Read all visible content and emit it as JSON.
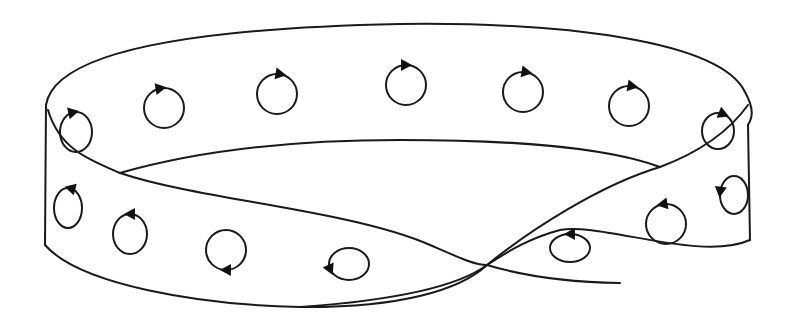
{
  "figure": {
    "title": "Möbius strip with orientation circles",
    "stroke_color": "#1a1a1a",
    "background": "#ffffff"
  },
  "strip": {
    "edges": [
      {
        "name": "outer-top-edge",
        "d": "M 46 105 C 55 50, 200 28, 400 24 C 560 22, 720 40, 745 92 C 755 110, 752 118, 748 125"
      },
      {
        "name": "left-side-edge",
        "d": "M 46 105 L 45 245"
      },
      {
        "name": "right-side-edge",
        "d": "M 748 125 L 750 240"
      },
      {
        "name": "bottom-edge",
        "d": "M 45 245 C 80 285, 200 305, 300 307 C 400 308, 460 290, 487 265 C 510 250, 530 238, 560 230 C 600 222, 700 262, 750 240"
      },
      {
        "name": "inner-back-edge",
        "d": "M 120 173 C 200 150, 300 140, 400 140 C 500 140, 600 145, 660 167"
      },
      {
        "name": "twist-front-left-edge",
        "d": "M 48 110 C 60 150, 90 160, 120 173 C 200 200, 350 210, 430 245 C 460 258, 475 265, 487 265 C 520 275, 560 282, 620 283"
      },
      {
        "name": "twist-rising-edge",
        "d": "M 300 307 C 400 300, 460 285, 487 265 C 530 230, 600 185, 660 167 C 700 152, 730 130, 748 105"
      }
    ]
  },
  "orientation_circles": [
    {
      "cx": 76,
      "cy": 132,
      "rx": 16,
      "ry": 20,
      "arrow_angle": -100,
      "direction": "cw"
    },
    {
      "cx": 164,
      "cy": 108,
      "rx": 20,
      "ry": 20,
      "arrow_angle": -100,
      "direction": "cw"
    },
    {
      "cx": 277,
      "cy": 94,
      "rx": 20,
      "ry": 20,
      "arrow_angle": -80,
      "direction": "cw"
    },
    {
      "cx": 406,
      "cy": 85,
      "rx": 20,
      "ry": 20,
      "arrow_angle": -90,
      "direction": "cw"
    },
    {
      "cx": 523,
      "cy": 92,
      "rx": 20,
      "ry": 20,
      "arrow_angle": -80,
      "direction": "cw"
    },
    {
      "cx": 629,
      "cy": 106,
      "rx": 20,
      "ry": 20,
      "arrow_angle": -80,
      "direction": "cw"
    },
    {
      "cx": 718,
      "cy": 131,
      "rx": 16,
      "ry": 18,
      "arrow_angle": -70,
      "direction": "cw"
    },
    {
      "cx": 68,
      "cy": 208,
      "rx": 14,
      "ry": 20,
      "arrow_angle": -80,
      "direction": "ccw"
    },
    {
      "cx": 130,
      "cy": 234,
      "rx": 17,
      "ry": 20,
      "arrow_angle": -90,
      "direction": "ccw"
    },
    {
      "cx": 226,
      "cy": 250,
      "rx": 20,
      "ry": 20,
      "arrow_angle": 90,
      "direction": "cw"
    },
    {
      "cx": 349,
      "cy": 264,
      "rx": 20,
      "ry": 16,
      "arrow_angle": 160,
      "direction": "ccw"
    },
    {
      "cx": 570,
      "cy": 248,
      "rx": 20,
      "ry": 14,
      "arrow_angle": -90,
      "direction": "ccw"
    },
    {
      "cx": 666,
      "cy": 224,
      "rx": 20,
      "ry": 20,
      "arrow_angle": -100,
      "direction": "ccw"
    },
    {
      "cx": 734,
      "cy": 195,
      "rx": 14,
      "ry": 19,
      "arrow_angle": 190,
      "direction": "ccw"
    }
  ]
}
